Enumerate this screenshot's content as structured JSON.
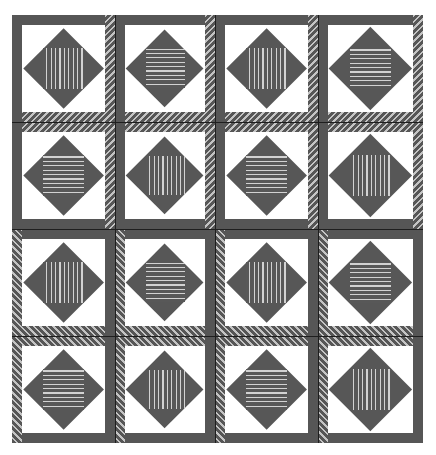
{
  "colors": {
    "frame": "#565656",
    "hatch_light": "#c4c4c4",
    "background": "#ffffff",
    "diamond": "#575757",
    "stripe_light": "#d2d2d2",
    "divider": "#1e1e1e"
  },
  "grid": {
    "rows": 4,
    "cols": 4,
    "col_edges": [
      0,
      103,
      203,
      306,
      411
    ],
    "row_edges": [
      0,
      107,
      214,
      321,
      428
    ]
  },
  "row_frames": [
    {
      "top": "solid",
      "left": "solid",
      "right": "hatch",
      "bottom": "hatch"
    },
    {
      "top": "hatch",
      "left": "solid",
      "right": "hatch",
      "bottom": "solid"
    },
    {
      "top": "solid",
      "left": "hatch",
      "right": "solid",
      "bottom": "hatch"
    },
    {
      "top": "hatch",
      "left": "hatch",
      "right": "solid",
      "bottom": "solid"
    }
  ],
  "blocks": [
    [
      "vertical",
      "horizontal",
      "vertical",
      "horizontal"
    ],
    [
      "horizontal",
      "vertical",
      "horizontal",
      "vertical"
    ],
    [
      "vertical",
      "horizontal",
      "vertical",
      "horizontal"
    ],
    [
      "horizontal",
      "vertical",
      "horizontal",
      "vertical"
    ]
  ]
}
